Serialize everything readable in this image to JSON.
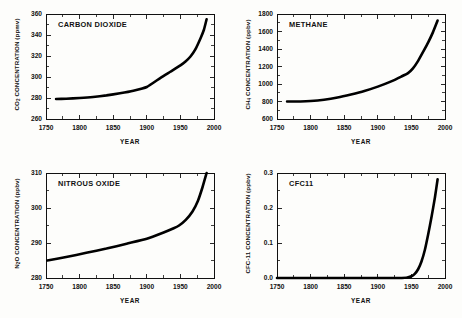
{
  "figure": {
    "background_color": "#fdfdfb",
    "curve_color": "#000000",
    "axis_color": "#111111"
  },
  "panels": [
    {
      "key": "co2",
      "title": "CARBON  DIOXIDE",
      "ylabel_main": "CO",
      "ylabel_sub": "2",
      "ylabel_rest": " CONCENTRATION  (ppmv)",
      "xlabel": "YEAR"
    },
    {
      "key": "ch4",
      "title": "METHANE",
      "ylabel_main": "CH",
      "ylabel_sub": "4",
      "ylabel_rest": " CONCENTRATION  (ppbv)",
      "xlabel": "YEAR"
    },
    {
      "key": "n2o",
      "title": "NITROUS  OXIDE",
      "ylabel_main": "N",
      "ylabel_sub": "2",
      "ylabel_rest": "O  CONCENTRATION  (ppbv)",
      "xlabel": "YEAR"
    },
    {
      "key": "cfc11",
      "title": "CFC11",
      "ylabel_main": "CFC-11  CONCENTRATION  (ppbv)",
      "ylabel_sub": "",
      "ylabel_rest": "",
      "xlabel": "YEAR"
    }
  ],
  "chart_data": [
    {
      "type": "line",
      "key": "co2",
      "title": "CARBON  DIOXIDE",
      "xlabel": "YEAR",
      "ylabel": "CO2 CONCENTRATION (ppmv)",
      "xlim": [
        1750,
        2000
      ],
      "ylim": [
        260,
        360
      ],
      "xticks": [
        1750,
        1800,
        1850,
        1900,
        1950,
        2000
      ],
      "yticks": [
        260,
        280,
        300,
        320,
        340,
        360
      ],
      "xminor_step": 25,
      "yminor_step": 10,
      "grid": false,
      "legend": "none",
      "x": [
        1765,
        1780,
        1800,
        1820,
        1840,
        1860,
        1880,
        1900,
        1920,
        1935,
        1950,
        1958,
        1965,
        1972,
        1980,
        1985,
        1989
      ],
      "values": [
        279,
        279.3,
        280,
        281,
        282.5,
        284.5,
        287,
        290.5,
        299,
        305,
        311,
        315,
        319.5,
        326,
        337,
        345,
        355
      ]
    },
    {
      "type": "line",
      "key": "ch4",
      "title": "METHANE",
      "xlabel": "YEAR",
      "ylabel": "CH4 CONCENTRATION (ppbv)",
      "xlim": [
        1750,
        2000
      ],
      "ylim": [
        600,
        1800
      ],
      "xticks": [
        1750,
        1800,
        1850,
        1900,
        1950,
        2000
      ],
      "yticks": [
        600,
        800,
        1000,
        1200,
        1400,
        1600,
        1800
      ],
      "xminor_step": 25,
      "yminor_step": 100,
      "grid": false,
      "legend": "none",
      "x": [
        1765,
        1785,
        1800,
        1820,
        1840,
        1860,
        1880,
        1900,
        1920,
        1935,
        1945,
        1952,
        1960,
        1968,
        1975,
        1982,
        1989
      ],
      "values": [
        800,
        800,
        805,
        820,
        845,
        880,
        920,
        970,
        1030,
        1085,
        1125,
        1175,
        1265,
        1375,
        1475,
        1590,
        1725
      ]
    },
    {
      "type": "line",
      "key": "n2o",
      "title": "NITROUS  OXIDE",
      "xlabel": "YEAR",
      "ylabel": "N2O CONCENTRATION (ppbv)",
      "xlim": [
        1750,
        2000
      ],
      "ylim": [
        280,
        310
      ],
      "xticks": [
        1750,
        1800,
        1850,
        1900,
        1950,
        2000
      ],
      "yticks": [
        280,
        290,
        300,
        310
      ],
      "xminor_step": 25,
      "yminor_step": 5,
      "grid": false,
      "legend": "none",
      "x": [
        1752,
        1780,
        1810,
        1840,
        1870,
        1900,
        1925,
        1940,
        1948,
        1958,
        1968,
        1976,
        1983,
        1989
      ],
      "values": [
        285,
        286,
        287.2,
        288.4,
        289.8,
        291.2,
        293,
        294.2,
        295,
        296.6,
        299,
        302,
        306,
        310
      ]
    },
    {
      "type": "line",
      "key": "cfc11",
      "title": "CFC11",
      "xlabel": "YEAR",
      "ylabel": "CFC-11 CONCENTRATION (ppbv)",
      "xlim": [
        1750,
        2000
      ],
      "ylim": [
        0.0,
        0.3
      ],
      "xticks": [
        1750,
        1800,
        1850,
        1900,
        1950,
        2000
      ],
      "yticks": [
        "0.0",
        "0.1",
        "0.2",
        "0.3"
      ],
      "ytick_values": [
        0.0,
        0.1,
        0.2,
        0.3
      ],
      "xminor_step": 25,
      "yminor_step": 0.05,
      "grid": false,
      "legend": "none",
      "x": [
        1750,
        1930,
        1945,
        1950,
        1955,
        1960,
        1965,
        1970,
        1975,
        1980,
        1985,
        1989
      ],
      "values": [
        0.0,
        0.0,
        0.002,
        0.005,
        0.012,
        0.025,
        0.047,
        0.08,
        0.125,
        0.175,
        0.23,
        0.282
      ]
    }
  ]
}
